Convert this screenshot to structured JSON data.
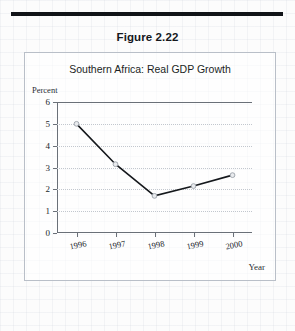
{
  "figure": {
    "number_label": "Figure 2.22"
  },
  "chart_data": {
    "type": "line",
    "title": "Southern Africa: Real GDP Growth",
    "xlabel": "Year",
    "ylabel": "Percent",
    "categories": [
      "1996",
      "1997",
      "1998",
      "1999",
      "2000"
    ],
    "values": [
      5.0,
      3.15,
      1.7,
      2.15,
      2.65
    ],
    "series": [
      {
        "name": "Real GDP Growth",
        "values": [
          5.0,
          3.15,
          1.7,
          2.15,
          2.65
        ]
      }
    ],
    "ylim": [
      0,
      6
    ],
    "yticks": [
      "0",
      "1",
      "2",
      "3",
      "4",
      "5",
      "6"
    ],
    "grid": true,
    "legend": "none",
    "line_color": "#15181c",
    "marker_color": "#e9ebee"
  }
}
